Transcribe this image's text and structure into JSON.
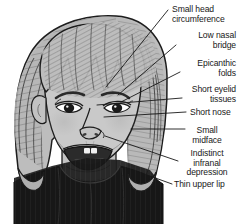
{
  "figure": {
    "background_color": "#ffffff",
    "ink_color": "#181818",
    "skin_color": "#c9c9c9",
    "hair_color": "#b0b0b0",
    "garment_color": "#171717",
    "width": 241,
    "height": 224
  },
  "annotations": [
    {
      "id": "small-head-circumference",
      "lines": [
        "Small head",
        "circumference"
      ],
      "align": "left",
      "text_x": 172,
      "text_y": 5,
      "leader": {
        "x1": 168,
        "y1": 10,
        "x2": 106,
        "y2": 87
      }
    },
    {
      "id": "low-nasal-bridge",
      "lines": [
        "Low nasal",
        "bridge"
      ],
      "align": "right",
      "text_x": 178,
      "text_y": 31,
      "leader": {
        "x1": 176,
        "y1": 45,
        "x2": 118,
        "y2": 95
      }
    },
    {
      "id": "epicanthic-folds",
      "lines": [
        "Epicanthic",
        "folds"
      ],
      "align": "right",
      "text_x": 182,
      "text_y": 59,
      "leader": {
        "x1": 180,
        "y1": 72,
        "x2": 121,
        "y2": 102
      }
    },
    {
      "id": "short-eyelid-tissues",
      "lines": [
        "Short eyelid",
        "tissues"
      ],
      "align": "right",
      "text_x": 184,
      "text_y": 85,
      "leader": {
        "x1": 182,
        "y1": 98,
        "x2": 97,
        "y2": 105
      }
    },
    {
      "id": "short-nose",
      "lines": [
        "Short nose"
      ],
      "align": "left",
      "text_x": 190,
      "text_y": 108,
      "leader": {
        "x1": 186,
        "y1": 112,
        "x2": 104,
        "y2": 117
      }
    },
    {
      "id": "small-midface",
      "lines": [
        "Small",
        "midface"
      ],
      "align": "center",
      "text_x": 187,
      "text_y": 126,
      "leader": {
        "x1": 185,
        "y1": 129,
        "x2": 131,
        "y2": 129
      }
    },
    {
      "id": "indistinct-infranal-depression",
      "lines": [
        "Indistinct",
        "infranal",
        "depression"
      ],
      "align": "right",
      "text_x": 180,
      "text_y": 149,
      "leader": {
        "x1": 178,
        "y1": 161,
        "x2": 105,
        "y2": 136
      }
    },
    {
      "id": "thin-upper-lip",
      "lines": [
        "Thin upper lip"
      ],
      "align": "left",
      "text_x": 174,
      "text_y": 180,
      "leader": {
        "x1": 172,
        "y1": 184,
        "x2": 147,
        "y2": 175
      }
    }
  ],
  "icons": {
    "portrait": "child-face-illustration"
  }
}
